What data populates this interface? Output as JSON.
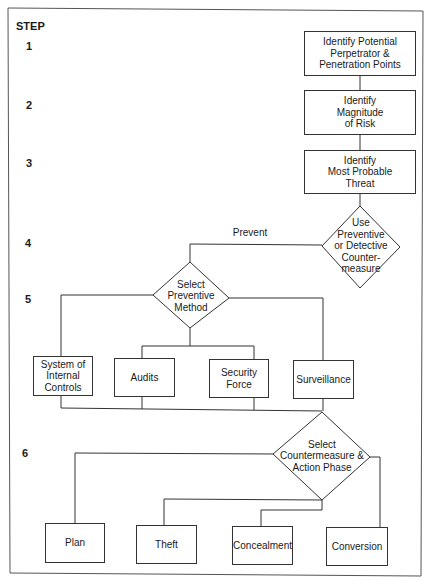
{
  "step_header": "STEP",
  "steps": [
    {
      "number": "1",
      "y": 45
    },
    {
      "number": "2",
      "y": 104
    },
    {
      "number": "3",
      "y": 163
    },
    {
      "number": "4",
      "y": 242
    },
    {
      "number": "5",
      "y": 299
    },
    {
      "number": "6",
      "y": 453
    }
  ],
  "nodes": {
    "identify_perpetrator": {
      "text": "Identify Potential\nPerpetrator &\nPenetration Points"
    },
    "identify_magnitude": {
      "text": "Identify\nMagnitude\nof Risk"
    },
    "identify_threat": {
      "text": "Identify\nMost Probable\nThreat"
    },
    "use_countermeasure": {
      "text": "Use\nPreventive\nor Detective\nCounter-\nmeasure"
    },
    "select_preventive": {
      "text": "Select\nPreventive\nMethod"
    },
    "internal_controls": {
      "text": "System of\nInternal\nControls"
    },
    "audits": {
      "text": "Audits"
    },
    "security_force": {
      "text": "Security\nForce"
    },
    "surveillance": {
      "text": "Surveillance"
    },
    "select_countermeasure": {
      "text": "Select\nCountermeasure &\nAction Phase"
    },
    "plan": {
      "text": "Plan"
    },
    "theft": {
      "text": "Theft"
    },
    "concealment": {
      "text": "Concealment"
    },
    "conversion": {
      "text": "Conversion"
    }
  },
  "edge_labels": {
    "prevent": "Prevent"
  },
  "colors": {
    "line": "#333333",
    "frame": "#555555",
    "background": "#ffffff"
  }
}
